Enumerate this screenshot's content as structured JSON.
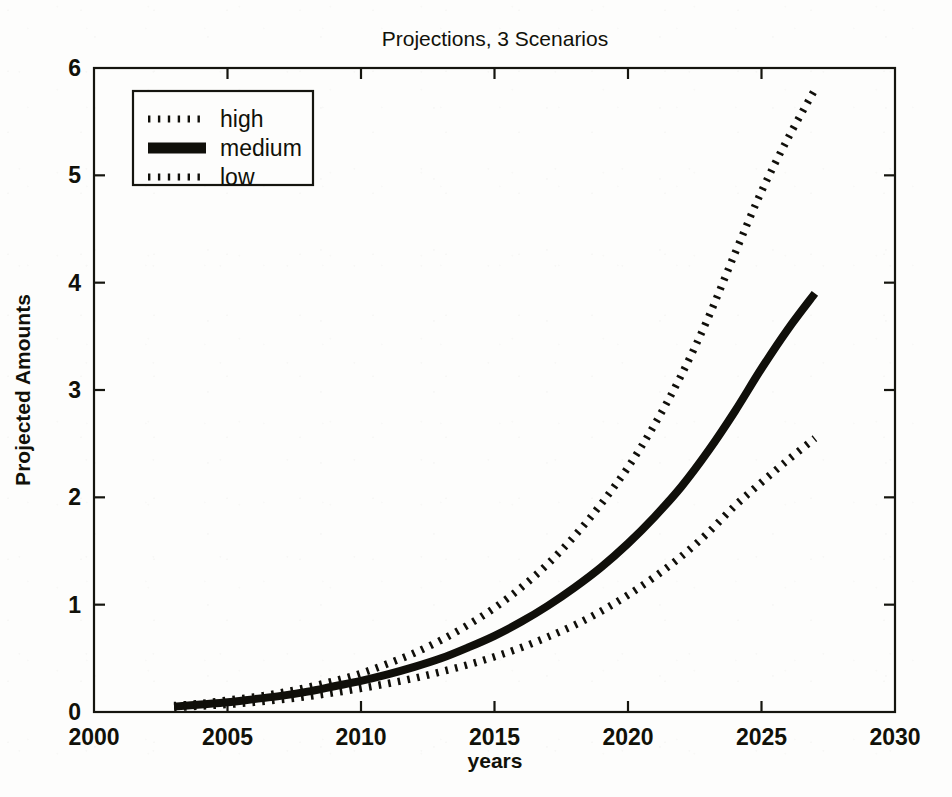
{
  "chart_data": {
    "type": "line",
    "title": "Projections, 3 Scenarios",
    "xlabel": "years",
    "ylabel": "Projected Amounts",
    "xlim": [
      2000,
      2030
    ],
    "ylim": [
      0,
      6
    ],
    "xticks": [
      2000,
      2005,
      2010,
      2015,
      2020,
      2025,
      2030
    ],
    "xticklabels": [
      "2000",
      "2005",
      "2010",
      "2015",
      "2020",
      "2025",
      "2030"
    ],
    "yticks": [
      0,
      1,
      2,
      3,
      4,
      5,
      6
    ],
    "yticklabels": [
      "0",
      "1",
      "2",
      "3",
      "4",
      "5",
      "6"
    ],
    "grid": false,
    "legend_position": "upper left",
    "x": [
      2003,
      2004,
      2005,
      2006,
      2007,
      2008,
      2009,
      2010,
      2011,
      2012,
      2013,
      2014,
      2015,
      2016,
      2017,
      2018,
      2019,
      2020,
      2021,
      2022,
      2023,
      2024,
      2025,
      2026,
      2027
    ],
    "series": [
      {
        "name": "high",
        "style": "dotted",
        "values": [
          0.06,
          0.08,
          0.11,
          0.14,
          0.18,
          0.23,
          0.29,
          0.36,
          0.45,
          0.55,
          0.67,
          0.81,
          0.97,
          1.16,
          1.38,
          1.64,
          1.94,
          2.28,
          2.68,
          3.14,
          3.67,
          4.27,
          4.85,
          5.35,
          5.8
        ]
      },
      {
        "name": "medium",
        "style": "solid",
        "values": [
          0.05,
          0.07,
          0.09,
          0.12,
          0.15,
          0.19,
          0.24,
          0.29,
          0.35,
          0.42,
          0.5,
          0.6,
          0.71,
          0.84,
          0.99,
          1.16,
          1.35,
          1.57,
          1.82,
          2.1,
          2.43,
          2.8,
          3.2,
          3.57,
          3.9
        ]
      },
      {
        "name": "low",
        "style": "dotted",
        "values": [
          0.04,
          0.055,
          0.07,
          0.09,
          0.115,
          0.145,
          0.18,
          0.22,
          0.265,
          0.315,
          0.375,
          0.44,
          0.515,
          0.6,
          0.7,
          0.81,
          0.94,
          1.09,
          1.26,
          1.45,
          1.67,
          1.92,
          2.14,
          2.35,
          2.55
        ]
      }
    ],
    "legend_entries": [
      {
        "label": "high",
        "style": "dotted"
      },
      {
        "label": "medium",
        "style": "solid"
      },
      {
        "label": "low",
        "style": "dotted"
      }
    ],
    "colors": {
      "line": "#100f0a",
      "axis": "#15150f",
      "background": "#fdfdfc"
    }
  }
}
